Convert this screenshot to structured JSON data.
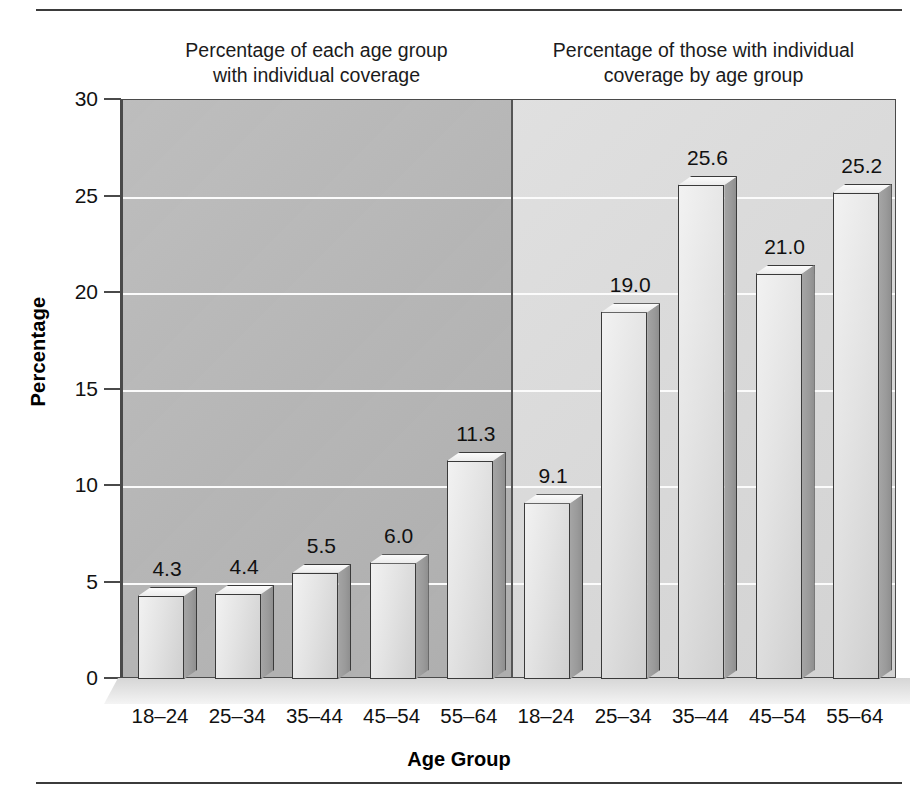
{
  "figure": {
    "panel_captions": [
      "Percentage of each age group\nwith individual coverage",
      "Percentage of those with individual\ncoverage by age group"
    ],
    "x_axis_title": "Age Group",
    "y_axis_title": "Percentage"
  },
  "chart_data": {
    "type": "bar",
    "title": "",
    "subtitle": "",
    "xlabel": "Age Group",
    "ylabel": "Percentage",
    "ylim": [
      0,
      30
    ],
    "yticks": [
      0,
      5,
      10,
      15,
      20,
      25,
      30
    ],
    "ytick_labels": [
      "0",
      "5",
      "10",
      "15",
      "20",
      "25",
      "30"
    ],
    "grid": true,
    "legend": "none",
    "panels": [
      {
        "caption": "Percentage of each age group with individual coverage",
        "categories": [
          "18–24",
          "25–34",
          "35–44",
          "45–54",
          "55–64"
        ],
        "values": [
          4.3,
          4.4,
          5.5,
          6.0,
          11.3
        ],
        "value_labels": [
          "4.3",
          "4.4",
          "5.5",
          "6.0",
          "11.3"
        ]
      },
      {
        "caption": "Percentage of those with individual coverage by age group",
        "categories": [
          "18–24",
          "25–34",
          "35–44",
          "45–54",
          "55–64"
        ],
        "values": [
          9.1,
          19.0,
          25.6,
          21.0,
          25.2
        ],
        "value_labels": [
          "9.1",
          "19.0",
          "25.6",
          "21.0",
          "25.2"
        ]
      }
    ],
    "categories": [
      "18–24",
      "25–34",
      "35–44",
      "45–54",
      "55–64",
      "18–24",
      "25–34",
      "35–44",
      "45–54",
      "55–64"
    ],
    "values": [
      4.3,
      4.4,
      5.5,
      6.0,
      11.3,
      9.1,
      19.0,
      25.6,
      21.0,
      25.2
    ],
    "colors": {
      "panel_left_background": "#b6b6b6",
      "panel_right_background": "#d9d9d9",
      "bar_face": "#e3e3e3",
      "bar_side": "#9a9a9a",
      "gridline": "#fbfbfb",
      "axis": "#4a4a4a",
      "text": "#111111"
    }
  }
}
